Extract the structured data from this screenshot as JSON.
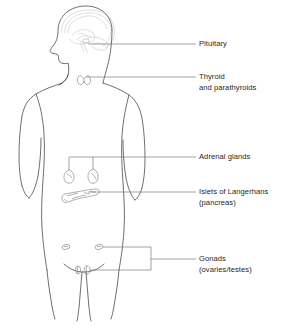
{
  "diagram": {
    "view": "anterior with head in left profile",
    "colors": {
      "background": "#ffffff",
      "body_outline": "#4a4a4a",
      "organ_outline": "#8d8d8d",
      "brain_detail": "#b9b9b9",
      "leader_line": "#7d7d7d",
      "text": "#262626"
    }
  },
  "labels": [
    {
      "id": "pituitary",
      "line1": "Pituitary",
      "line2": "",
      "x": 199,
      "y": 39,
      "leader_y": 44,
      "organ": "pituitary-gland"
    },
    {
      "id": "thyroid",
      "line1": "Thyroid",
      "line2": "and parathyroids",
      "x": 199,
      "y": 72,
      "leader_y": 77,
      "organ": "thyroid-gland"
    },
    {
      "id": "adrenal",
      "line1": "Adrenal glands",
      "line2": "",
      "x": 199,
      "y": 152,
      "leader_y": 157,
      "organ": "adrenal-glands"
    },
    {
      "id": "islets",
      "line1": "Islets of Langerhans",
      "line2": "(pancreas)",
      "x": 199,
      "y": 187,
      "leader_y": 192,
      "organ": "pancreas"
    },
    {
      "id": "gonads",
      "line1": "Gonads",
      "line2": "(ovaries/testes)",
      "x": 199,
      "y": 254,
      "leader_y": 259,
      "organ": "gonads"
    }
  ],
  "organs": [
    {
      "id": "pituitary-gland",
      "name": "Pituitary",
      "location": "base of brain"
    },
    {
      "id": "thyroid-gland",
      "name": "Thyroid and parathyroids",
      "location": "neck"
    },
    {
      "id": "adrenal-glands",
      "name": "Adrenal glands",
      "location": "above kidneys",
      "count": 2
    },
    {
      "id": "pancreas",
      "name": "Islets of Langerhans (pancreas)",
      "location": "upper abdomen"
    },
    {
      "id": "ovaries",
      "name": "Ovaries",
      "location": "pelvis",
      "count": 2
    },
    {
      "id": "testes",
      "name": "Testes",
      "location": "lower pelvis",
      "count": 2
    }
  ]
}
